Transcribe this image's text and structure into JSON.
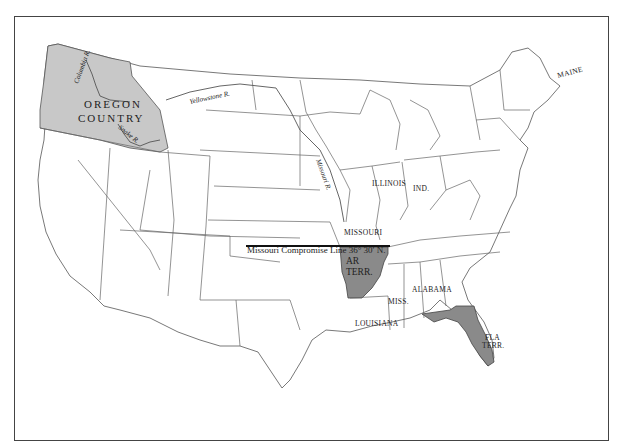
{
  "map": {
    "title": "",
    "colors": {
      "background": "#ffffff",
      "state_fill": "#ffffff",
      "oregon_country_fill": "#c8c8c8",
      "arkansas_territory_fill": "#8a8a8a",
      "florida_territory_fill": "#8a8a8a",
      "compromise_line": "#111111"
    },
    "regions": {
      "oregon_country": {
        "line1": "OREGON",
        "line2": "COUNTRY"
      },
      "arkansas_territory": {
        "line1": "AR",
        "line2": "TERR."
      },
      "florida_territory": {
        "line1": "FLA",
        "line2": "TERR."
      }
    },
    "state_labels": {
      "missouri": "MISSOURI",
      "illinois": "ILLINOIS",
      "indiana": "IND.",
      "mississippi": "MISS.",
      "alabama": "ALABAMA",
      "louisiana": "LOUISIANA",
      "maine": "MAINE"
    },
    "rivers": {
      "columbia": "Columbia R.",
      "snake": "Snake R.",
      "yellowstone": "Yellowstone R.",
      "missouri": "Missouri R."
    },
    "compromise_line": {
      "label": "Missouri Compromise Line 36° 30′ N."
    }
  }
}
